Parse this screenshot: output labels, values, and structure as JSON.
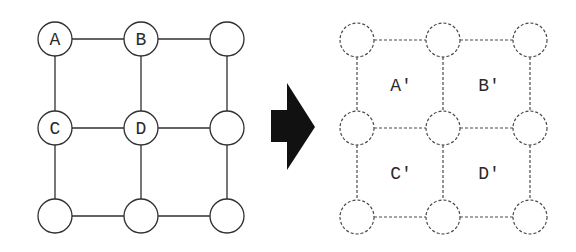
{
  "source_grid": {
    "cols": [
      55,
      141,
      227
    ],
    "rows": [
      39,
      128,
      216
    ],
    "radius": 17,
    "stroke": "#2f2f2f",
    "nodes": [
      {
        "label": "A"
      },
      {
        "label": "B"
      },
      {
        "label": ""
      },
      {
        "label": "C"
      },
      {
        "label": "D"
      },
      {
        "label": ""
      },
      {
        "label": ""
      },
      {
        "label": ""
      },
      {
        "label": ""
      }
    ]
  },
  "arrow": {
    "color": "#111111",
    "direction": "right"
  },
  "target_grid": {
    "cols": [
      357,
      443,
      530
    ],
    "rows": [
      40,
      128,
      217
    ],
    "radius": 17,
    "stroke": "#4a4a4a",
    "dashed": true,
    "cell_labels": [
      {
        "label": "A′"
      },
      {
        "label": "B′"
      },
      {
        "label": "C′"
      },
      {
        "label": "D′"
      }
    ]
  }
}
